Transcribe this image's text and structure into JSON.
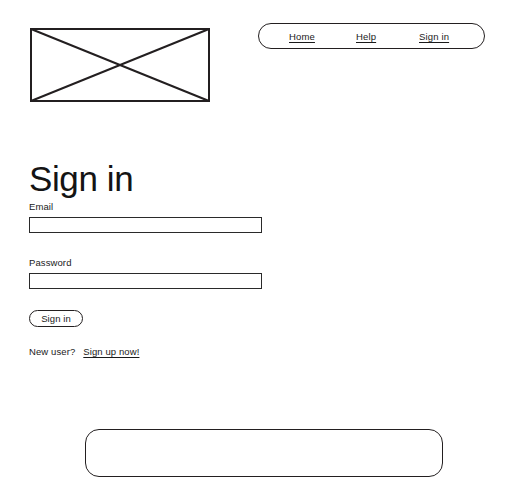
{
  "header": {
    "logo": {
      "icon": "image-placeholder-icon",
      "alt": "Logo image placeholder"
    },
    "nav": {
      "items": [
        {
          "label": "Home",
          "name": "nav-link-home"
        },
        {
          "label": "Help",
          "name": "nav-link-help"
        },
        {
          "label": "Sign in",
          "name": "nav-link-signin"
        }
      ]
    }
  },
  "main": {
    "title": "Sign in",
    "form": {
      "email": {
        "label": "Email",
        "value": "",
        "placeholder": ""
      },
      "password": {
        "label": "Password",
        "value": "",
        "placeholder": ""
      },
      "submit_label": "Sign in"
    },
    "new_user": {
      "text": "New user?",
      "link_label": "Sign up now!"
    }
  },
  "footer": {
    "panel": {
      "name": "footer-panel"
    }
  },
  "colors": {
    "stroke": "#231f20",
    "text": "#1a1a1a",
    "background": "#ffffff"
  }
}
